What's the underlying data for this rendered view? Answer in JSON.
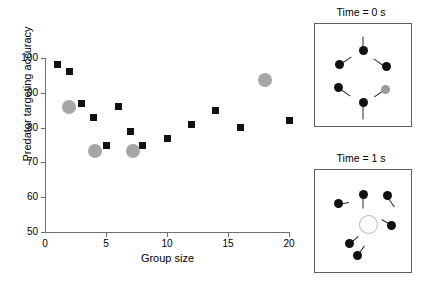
{
  "chart_data": {
    "type": "scatter",
    "title": "",
    "xlabel": "Group size",
    "ylabel": "Predator targeting accuracy",
    "xlim": [
      0,
      20
    ],
    "ylim": [
      50,
      100
    ],
    "xticks": [
      0,
      5,
      10,
      15,
      20
    ],
    "yticks": [
      50,
      60,
      70,
      80,
      90,
      100
    ],
    "grid": false,
    "legend": "none",
    "series": [
      {
        "name": "black-squares",
        "marker": "square",
        "color": "#121212",
        "points": [
          {
            "x": 1,
            "y": 98
          },
          {
            "x": 2,
            "y": 96
          },
          {
            "x": 3,
            "y": 87
          },
          {
            "x": 4,
            "y": 83
          },
          {
            "x": 5,
            "y": 75
          },
          {
            "x": 6,
            "y": 86
          },
          {
            "x": 7,
            "y": 79
          },
          {
            "x": 8,
            "y": 75
          },
          {
            "x": 10,
            "y": 77
          },
          {
            "x": 12,
            "y": 81
          },
          {
            "x": 14,
            "y": 85
          },
          {
            "x": 16,
            "y": 80
          },
          {
            "x": 20,
            "y": 82
          }
        ]
      },
      {
        "name": "grey-circles",
        "marker": "circle",
        "color": "#a6a6a6",
        "points": [
          {
            "x": 2,
            "y": 86
          },
          {
            "x": 4.1,
            "y": 73.3
          },
          {
            "x": 7.2,
            "y": 73.3
          },
          {
            "x": 18,
            "y": 93.7
          }
        ]
      }
    ]
  },
  "panels": [
    {
      "id": "time-0",
      "title": "Time = 0 s",
      "fish": [
        {
          "x": 50,
          "y": 26,
          "angle": 90,
          "tail": 15,
          "grey": false
        },
        {
          "x": 25,
          "y": 40,
          "angle": 35,
          "tail": 15,
          "grey": false
        },
        {
          "x": 74,
          "y": 42,
          "angle": 145,
          "tail": 15,
          "grey": false
        },
        {
          "x": 24,
          "y": 62,
          "angle": -35,
          "tail": 15,
          "grey": false
        },
        {
          "x": 73,
          "y": 64,
          "angle": -145,
          "tail": 13,
          "grey": true
        },
        {
          "x": 50,
          "y": 77,
          "angle": -90,
          "tail": 16,
          "grey": false
        }
      ],
      "target": null
    },
    {
      "id": "time-1",
      "title": "Time = 1 s",
      "fish": [
        {
          "x": 24,
          "y": 33,
          "angle": 10,
          "tail": 11,
          "grey": false
        },
        {
          "x": 50,
          "y": 24,
          "angle": -90,
          "tail": 14,
          "grey": false
        },
        {
          "x": 75,
          "y": 25,
          "angle": -55,
          "tail": 13,
          "grey": false
        },
        {
          "x": 80,
          "y": 54,
          "angle": 150,
          "tail": 12,
          "grey": false
        },
        {
          "x": 36,
          "y": 72,
          "angle": 40,
          "tail": 11,
          "grey": false
        },
        {
          "x": 44,
          "y": 84,
          "angle": 55,
          "tail": 13,
          "grey": false
        }
      ],
      "target": {
        "x": 55,
        "y": 52
      }
    }
  ]
}
